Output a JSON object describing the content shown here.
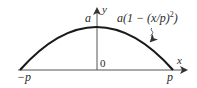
{
  "diagram": {
    "type": "function-plot",
    "curve": {
      "name": "parabola",
      "formula_label": "a(1 − (x/p)²)",
      "formula_parts": {
        "pre": "a(1 − (x/p)",
        "sup": "2",
        "post": ")"
      },
      "color": "#1a1a1a"
    },
    "axes": {
      "x_label": "x",
      "y_label": "y",
      "color": "#444444"
    },
    "labels": {
      "peak": "a",
      "origin": "0",
      "left_root": "−p",
      "right_root": "p"
    }
  }
}
